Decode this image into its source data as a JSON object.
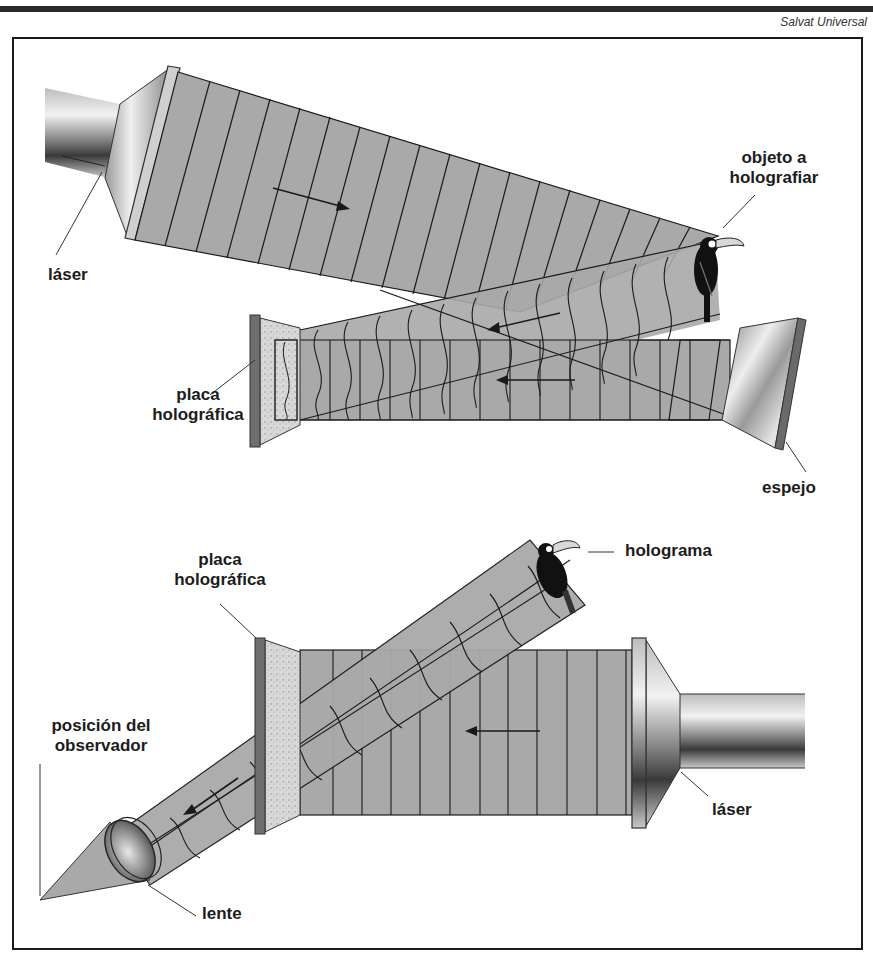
{
  "header": {
    "credit": "Salvat Universal"
  },
  "diagram": {
    "recording": {
      "labels": {
        "laser": "láser",
        "object_line1": "objeto a",
        "object_line2": "holografiar",
        "plate_line1": "placa",
        "plate_line2": "holográfica",
        "mirror": "espejo"
      }
    },
    "reconstruction": {
      "labels": {
        "hologram": "holograma",
        "plate_line1": "placa",
        "plate_line2": "holográfica",
        "observer_line1": "posición del",
        "observer_line2": "observador",
        "lens": "lente",
        "laser": "láser"
      }
    },
    "colors": {
      "beam_fill": "#a9a9a9",
      "wavefront_line": "#1a1a1a",
      "plate_fill": "#d4d4d4",
      "plate_edge": "#6e6e6e",
      "frame": "#1a1a1a"
    }
  }
}
